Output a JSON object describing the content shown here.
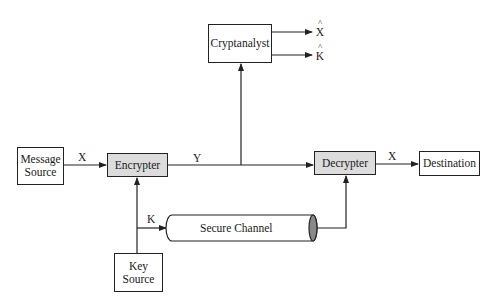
{
  "diagram": {
    "nodes": {
      "message_source": {
        "label_line1": "Message",
        "label_line2": "Source"
      },
      "encrypter": {
        "label": "Encrypter"
      },
      "decrypter": {
        "label": "Decrypter"
      },
      "destination": {
        "label": "Destination"
      },
      "cryptanalyst": {
        "label": "Cryptanalyst"
      },
      "key_source": {
        "label_line1": "Key",
        "label_line2": "Source"
      },
      "secure_channel": {
        "label": "Secure Channel"
      }
    },
    "edges": {
      "x_in": "X",
      "y": "Y",
      "x_out": "X",
      "k": "K",
      "x_hat": "X",
      "k_hat": "K",
      "hat_mark": "^"
    },
    "colors": {
      "line": "#222222",
      "shaded_box": "#dcdcdc",
      "channel_end": "#888888"
    }
  }
}
